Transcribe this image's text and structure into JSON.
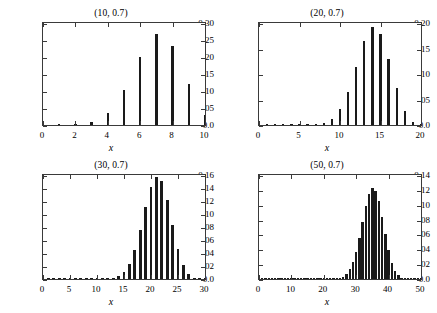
{
  "figure": {
    "background_color": "#ffffff",
    "bar_color": "#1a1a1a",
    "axis_color": "#3a3a3a",
    "panel_count": 4
  },
  "chart_data": [
    {
      "type": "bar",
      "title": "(10, 0.7)",
      "xlabel": "x",
      "ylabel": "",
      "grid": false,
      "legend": "none",
      "xlim": [
        0,
        10
      ],
      "ylim": [
        0,
        0.3
      ],
      "xticks": [
        0,
        2,
        4,
        6,
        8,
        10
      ],
      "xtick_labels": [
        "0",
        "2",
        "4",
        "6",
        "8",
        "10"
      ],
      "yticks": [
        0.0,
        0.05,
        0.1,
        0.15,
        0.2,
        0.25,
        0.3
      ],
      "ytick_labels": [
        "0.0",
        "0.05",
        "0.10",
        "0.15",
        "0.20",
        "0.25",
        "0.30"
      ],
      "categories": [
        0,
        1,
        2,
        3,
        4,
        5,
        6,
        7,
        8,
        9,
        10
      ],
      "values": [
        5.9e-06,
        0.000138,
        0.001447,
        0.009002,
        0.036757,
        0.102919,
        0.200121,
        0.266828,
        0.233474,
        0.121061,
        0.028248
      ]
    },
    {
      "type": "bar",
      "title": "(20, 0.7)",
      "xlabel": "x",
      "ylabel": "",
      "grid": false,
      "legend": "none",
      "xlim": [
        0,
        20
      ],
      "ylim": [
        0,
        0.2
      ],
      "xticks": [
        0,
        5,
        10,
        15,
        20
      ],
      "xtick_labels": [
        "0",
        "5",
        "10",
        "15",
        "20"
      ],
      "yticks": [
        0.0,
        0.05,
        0.1,
        0.15,
        0.2
      ],
      "ytick_labels": [
        "0.0",
        "0.05",
        "0.10",
        "0.15",
        "0.20"
      ],
      "categories": [
        0,
        1,
        2,
        3,
        4,
        5,
        6,
        7,
        8,
        9,
        10,
        11,
        12,
        13,
        14,
        15,
        16,
        17,
        18,
        19,
        20
      ],
      "values": [
        0.0,
        0.0,
        0.0,
        2e-07,
        2.2e-06,
        1.83e-05,
        0.0001166,
        0.000544,
        0.0019963,
        0.0053814,
        0.0308204,
        0.0653689,
        0.1143957,
        0.1642828,
        0.1916074,
        0.1788603,
        0.1304102,
        0.0716226,
        0.027831,
        0.0068303,
        0.0007979
      ]
    },
    {
      "type": "bar",
      "title": "(30, 0.7)",
      "xlabel": "x",
      "ylabel": "",
      "grid": false,
      "legend": "none",
      "xlim": [
        0,
        30
      ],
      "ylim": [
        0,
        0.16
      ],
      "xticks": [
        0,
        5,
        10,
        15,
        20,
        25,
        30
      ],
      "xtick_labels": [
        "0",
        "5",
        "10",
        "15",
        "20",
        "25",
        "30"
      ],
      "yticks": [
        0.0,
        0.02,
        0.04,
        0.06,
        0.08,
        0.1,
        0.12,
        0.14,
        0.16
      ],
      "ytick_labels": [
        "0.0",
        "0.02",
        "0.04",
        "0.06",
        "0.08",
        "0.10",
        "0.12",
        "0.14",
        "0.16"
      ],
      "categories": [
        0,
        1,
        2,
        3,
        4,
        5,
        6,
        7,
        8,
        9,
        10,
        11,
        12,
        13,
        14,
        15,
        16,
        17,
        18,
        19,
        20,
        21,
        22,
        23,
        24,
        25,
        26,
        27,
        28,
        29,
        30
      ],
      "values": [
        0.0,
        0.0,
        0.0,
        0.0,
        0.0,
        0.0,
        0.0,
        0.0,
        0.0,
        0.0,
        0.0,
        0.0001,
        0.0006,
        0.0026,
        0.0087,
        0.0243,
        0.0569,
        0.1115,
        0.1829,
        0.2493,
        0.0,
        0.0,
        0.0,
        0.0,
        0.0,
        0.0,
        0.0,
        0.0,
        0.0,
        0.0,
        0.0
      ]
    },
    {
      "type": "bar",
      "title": "(50, 0.7)",
      "xlabel": "x",
      "ylabel": "",
      "grid": false,
      "legend": "none",
      "xlim": [
        0,
        50
      ],
      "ylim": [
        0,
        0.14
      ],
      "xticks": [
        0,
        10,
        20,
        30,
        40,
        50
      ],
      "xtick_labels": [
        "0",
        "10",
        "20",
        "30",
        "40",
        "50"
      ],
      "yticks": [
        0.0,
        0.02,
        0.04,
        0.06,
        0.08,
        0.1,
        0.12,
        0.14
      ],
      "ytick_labels": [
        "0.0",
        "0.02",
        "0.04",
        "0.06",
        "0.08",
        "0.10",
        "0.12",
        "0.14"
      ],
      "categories": [
        0,
        1,
        2,
        3,
        4,
        5,
        6,
        7,
        8,
        9,
        10,
        11,
        12,
        13,
        14,
        15,
        16,
        17,
        18,
        19,
        20,
        21,
        22,
        23,
        24,
        25,
        26,
        27,
        28,
        29,
        30,
        31,
        32,
        33,
        34,
        35,
        36,
        37,
        38,
        39,
        40,
        41,
        42,
        43,
        44,
        45,
        46,
        47,
        48,
        49,
        50
      ],
      "values": [
        0.0,
        0.0,
        0.0,
        0.0,
        0.0,
        0.0,
        0.0,
        0.0,
        0.0,
        0.0,
        0.0,
        0.0,
        0.0,
        0.0,
        0.0,
        0.0,
        0.0,
        0.0,
        0.0,
        0.0,
        0.0,
        0.0,
        0.0,
        0.0,
        0.0,
        0.0,
        0.0,
        0.0,
        0.0,
        0.0,
        0.0,
        0.0,
        0.0,
        0.0,
        0.0,
        0.0,
        0.0,
        0.0,
        0.0,
        0.0,
        0.0,
        0.0,
        0.0,
        0.0,
        0.0,
        0.0,
        0.0,
        0.0,
        0.0,
        0.0,
        0.0
      ]
    }
  ]
}
